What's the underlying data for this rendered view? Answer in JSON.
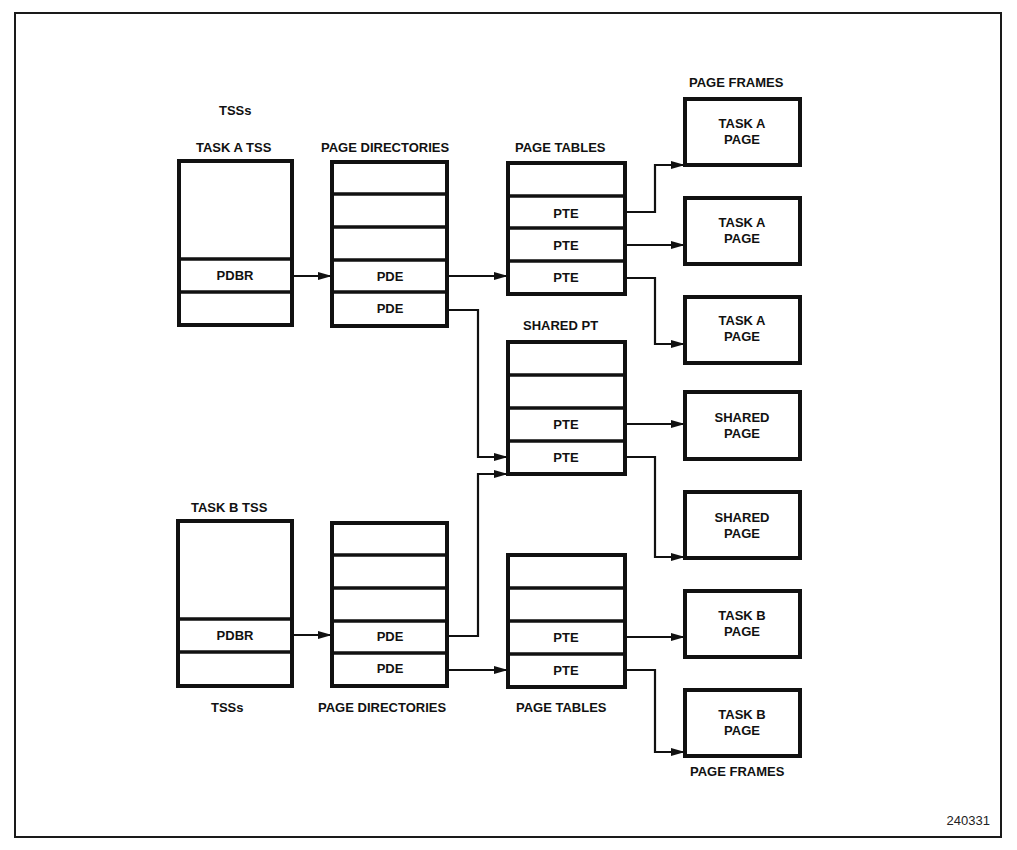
{
  "diagram": {
    "figure_number": "240331",
    "top_labels": {
      "tss_group": "TSSs",
      "task_a_tss": "TASK A TSS",
      "page_directories": "PAGE DIRECTORIES",
      "page_tables": "PAGE TABLES",
      "page_frames": "PAGE FRAMES",
      "shared_pt": "SHARED PT"
    },
    "bottom_labels": {
      "task_b_tss": "TASK B TSS",
      "tss_group": "TSSs",
      "page_directories": "PAGE DIRECTORIES",
      "page_tables": "PAGE TABLES",
      "page_frames": "PAGE FRAMES"
    },
    "task_a": {
      "tss_rows": [
        "",
        "PDBR",
        ""
      ],
      "page_directory_rows": [
        "",
        "",
        "",
        "PDE",
        "PDE"
      ],
      "page_table_rows": [
        "",
        "PTE",
        "PTE",
        "PTE"
      ]
    },
    "shared": {
      "page_table_rows": [
        "",
        "",
        "PTE",
        "PTE"
      ]
    },
    "task_b": {
      "tss_rows": [
        "",
        "PDBR",
        ""
      ],
      "page_directory_rows": [
        "",
        "",
        "",
        "PDE",
        "PDE"
      ],
      "page_table_rows": [
        "",
        "",
        "PTE",
        "PTE"
      ]
    },
    "page_frames": [
      {
        "line1": "TASK A",
        "line2": "PAGE"
      },
      {
        "line1": "TASK A",
        "line2": "PAGE"
      },
      {
        "line1": "TASK A",
        "line2": "PAGE"
      },
      {
        "line1": "SHARED",
        "line2": "PAGE"
      },
      {
        "line1": "SHARED",
        "line2": "PAGE"
      },
      {
        "line1": "TASK B",
        "line2": "PAGE"
      },
      {
        "line1": "TASK B",
        "line2": "PAGE"
      }
    ]
  }
}
